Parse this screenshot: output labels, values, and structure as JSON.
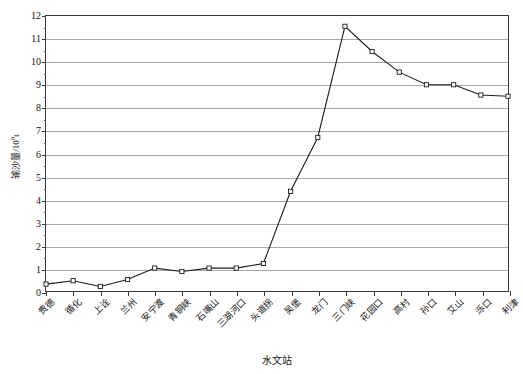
{
  "chart_data": {
    "type": "line",
    "title": "",
    "xlabel": "水文站",
    "ylabel": "输沙量/10⁸t",
    "ylabel_base": "输沙量/10",
    "ylabel_sup": "8",
    "ylabel_unit": "t",
    "categories": [
      "贵德",
      "循化",
      "上诠",
      "兰州",
      "安宁渡",
      "青铜峡",
      "石嘴山",
      "三湖河口",
      "头道拐",
      "吴堡",
      "龙门",
      "三门峡",
      "花园口",
      "高村",
      "孙口",
      "艾山",
      "泺口",
      "利津"
    ],
    "values": [
      0.3,
      0.45,
      0.2,
      0.5,
      1.0,
      0.85,
      1.0,
      1.0,
      1.2,
      4.35,
      6.7,
      11.55,
      10.45,
      9.55,
      9.0,
      9.0,
      8.55,
      8.5
    ],
    "ylim": [
      0,
      12
    ],
    "yticks": [
      0,
      1,
      2,
      3,
      4,
      5,
      6,
      7,
      8,
      9,
      10,
      11,
      12
    ],
    "ytick_labels": [
      "0",
      "1",
      "2",
      "3",
      "4",
      "5",
      "6",
      "7",
      "8",
      "9",
      "10",
      "11",
      "12"
    ],
    "yminor_ticks": [
      0.5,
      1.5,
      2.5,
      3.5,
      4.5,
      5.5,
      6.5,
      7.5,
      8.5,
      9.5,
      10.5,
      11.5
    ],
    "grid": true,
    "legend": false,
    "line_color": "#1c1c1c",
    "marker_color": "#ffffff",
    "marker_edge_color": "#1c1c1c",
    "grid_color": "#a9a9a9",
    "axis_color": "#3a3a3a",
    "marker": "square",
    "background": "#ffffff"
  }
}
